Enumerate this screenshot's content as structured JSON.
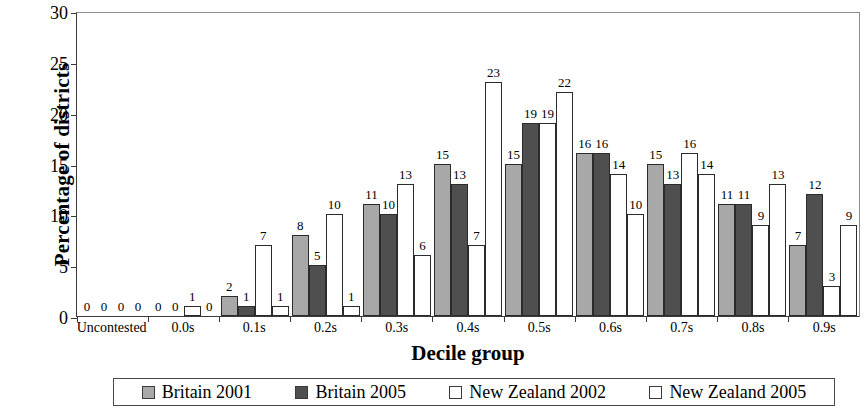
{
  "chart_data": {
    "type": "bar",
    "title": "",
    "xlabel": "Decile group",
    "ylabel": "Percentage of districts",
    "ylim": [
      0,
      30
    ],
    "yticks": [
      0,
      5,
      10,
      15,
      20,
      25,
      30
    ],
    "grid": false,
    "legend_position": "bottom",
    "categories": [
      "Uncontested",
      "0.0s",
      "0.1s",
      "0.2s",
      "0.3s",
      "0.4s",
      "0.5s",
      "0.6s",
      "0.7s",
      "0.8s",
      "0.9s"
    ],
    "series": [
      {
        "name": "Britain 2001",
        "color": "#a8a8a8",
        "values": [
          0,
          0,
          2,
          8,
          11,
          15,
          15,
          16,
          15,
          11,
          7
        ]
      },
      {
        "name": "Britain 2005",
        "color": "#4f4f4f",
        "values": [
          0,
          0,
          1,
          5,
          10,
          13,
          19,
          16,
          13,
          11,
          12
        ]
      },
      {
        "name": "New Zealand 2002",
        "color": "#ffffff",
        "values": [
          0,
          1,
          7,
          10,
          13,
          7,
          19,
          14,
          16,
          9,
          3
        ]
      },
      {
        "name": "New Zealand 2005",
        "color": "#ffffff",
        "values": [
          0,
          0,
          1,
          1,
          6,
          23,
          22,
          10,
          14,
          13,
          9
        ]
      }
    ]
  },
  "legend": {
    "items": [
      {
        "label": "Britain 2001"
      },
      {
        "label": "Britain 2005"
      },
      {
        "label": "New Zealand 2002"
      },
      {
        "label": "New Zealand 2005"
      }
    ]
  }
}
